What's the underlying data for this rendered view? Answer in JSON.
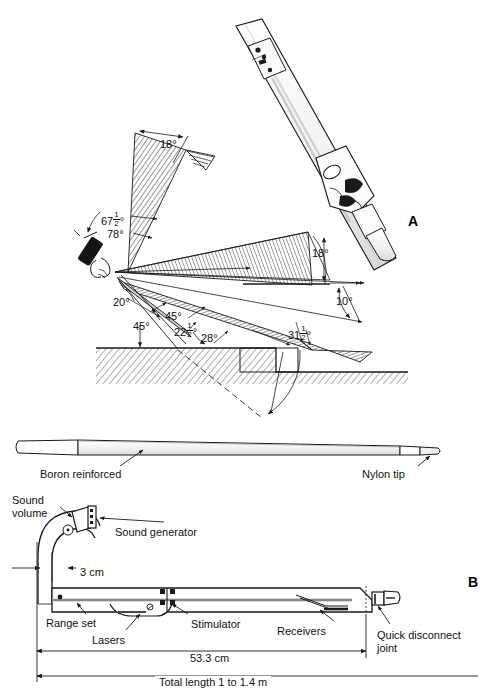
{
  "figure": {
    "kind": "technical-line-diagram",
    "background": "#ffffff",
    "ink": "#111111"
  },
  "panels": [
    {
      "id": "A",
      "label": "A"
    },
    {
      "id": "B",
      "label": "B"
    }
  ],
  "panel_a": {
    "description": "Side view of a laser cane held in the hand, showing the three fan-shaped laser beams (up-beam, forward beam, down-beam) and their angles relative to the cane axis and the ground.",
    "angles": [
      {
        "name": "up-beam-spread",
        "value": "18",
        "fraction": "",
        "unit": "°",
        "x": 160,
        "y": 138
      },
      {
        "name": "cane-to-up-beam",
        "value": "67",
        "fraction": "1/2",
        "unit": "°",
        "x": 101,
        "y": 211
      },
      {
        "name": "cane-elevation",
        "value": "78",
        "fraction": "",
        "unit": "°",
        "x": 107,
        "y": 228
      },
      {
        "name": "forward-beam-spread",
        "value": "18",
        "fraction": "",
        "unit": "°",
        "x": 312,
        "y": 247
      },
      {
        "name": "forward-beam-depress",
        "value": "10",
        "fraction": "",
        "unit": "°",
        "x": 336,
        "y": 295
      },
      {
        "name": "down-beam-from-cane",
        "value": "20",
        "fraction": "",
        "unit": "°",
        "x": 113,
        "y": 296
      },
      {
        "name": "down-beam-lower",
        "value": "45",
        "fraction": "",
        "unit": "°",
        "x": 133,
        "y": 320
      },
      {
        "name": "down-beam-upper",
        "value": "45",
        "fraction": "",
        "unit": "°",
        "x": 165,
        "y": 310
      },
      {
        "name": "down-beam-spread",
        "value": "22",
        "fraction": "1/2",
        "unit": "°",
        "x": 174,
        "y": 322
      },
      {
        "name": "down-beam-to-ground",
        "value": "28",
        "fraction": "",
        "unit": "°",
        "x": 201,
        "y": 332
      },
      {
        "name": "step-detect-angle",
        "value": "31",
        "fraction": "1/2",
        "unit": "°",
        "x": 288,
        "y": 325
      }
    ]
  },
  "panel_b": {
    "description": "Two elevation drawings of the cane: the plain boron-reinforced shaft with nylon tip, and the instrumented crook-handle head showing sound generator, lasers, receivers and dimensions.",
    "shaft_labels": [
      {
        "name": "boron-reinforced",
        "text": "Boron reinforced",
        "x": 40,
        "y": 468
      },
      {
        "name": "nylon-tip",
        "text": "Nylon tip",
        "x": 362,
        "y": 468
      }
    ],
    "head_labels": [
      {
        "name": "sound-volume",
        "text": "Sound\nvolume",
        "x": 12,
        "y": 494
      },
      {
        "name": "sound-generator",
        "text": "Sound generator",
        "x": 115,
        "y": 526
      },
      {
        "name": "range-set",
        "text": "Range set",
        "x": 46,
        "y": 617
      },
      {
        "name": "lasers",
        "text": "Lasers",
        "x": 92,
        "y": 634
      },
      {
        "name": "stimulator",
        "text": "Stimulator",
        "x": 191,
        "y": 618
      },
      {
        "name": "receivers",
        "text": "Receivers",
        "x": 277,
        "y": 625
      },
      {
        "name": "quick-disconnect-joint",
        "text": "Quick disconnect\njoint",
        "x": 377,
        "y": 629
      }
    ],
    "dimensions": [
      {
        "name": "crook-depth",
        "text": "3 cm",
        "x": 76,
        "y": 566
      },
      {
        "name": "head-length",
        "text": "53.3 cm",
        "x": 186,
        "y": 652
      },
      {
        "name": "total-length",
        "text": "Total length 1 to 1.4 m",
        "x": 155,
        "y": 676
      }
    ]
  }
}
